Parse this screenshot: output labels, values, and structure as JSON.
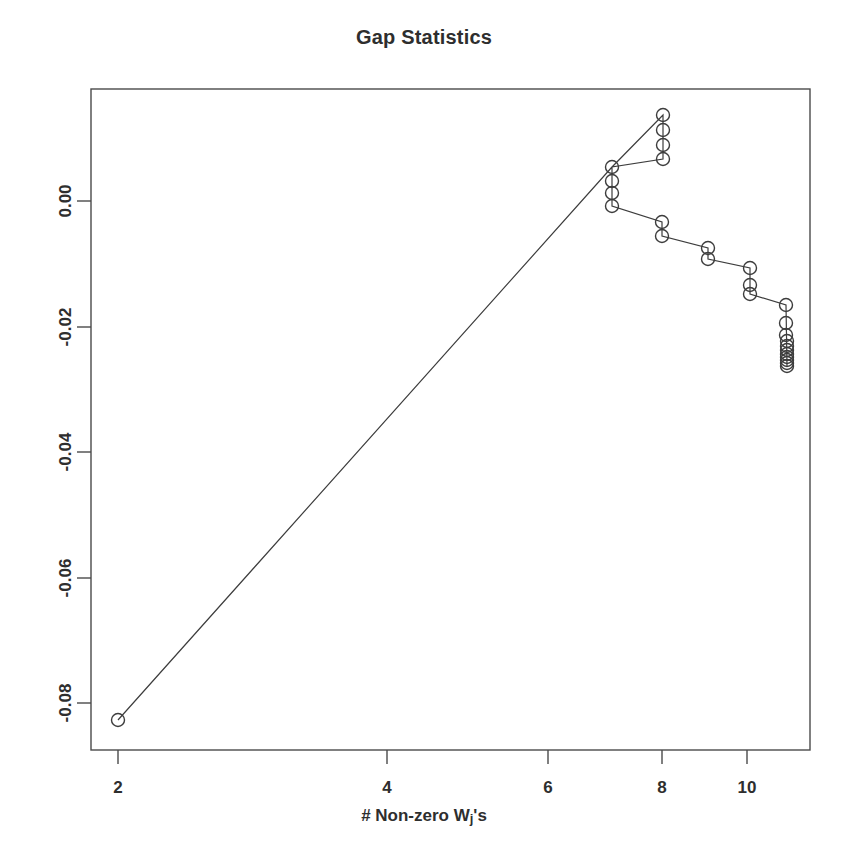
{
  "chart_data": {
    "type": "line",
    "title": "Gap Statistics",
    "xlabel": "# Non-zero Wj's",
    "xlabel_main": "# Non-zero W",
    "xlabel_sub": "j",
    "xlabel_tail": "'s",
    "ylabel": "",
    "marker": "open-circle",
    "grid": false,
    "legend": null,
    "xlim": [
      1.75,
      11.6
    ],
    "ylim": [
      -0.0875,
      0.0215
    ],
    "xticks": [
      2,
      4,
      6,
      8,
      10
    ],
    "xtick_labels": [
      "2",
      "4",
      "6",
      "8",
      "10"
    ],
    "xscale": "log-like (non-uniform tick spacing)",
    "yticks": [
      0.0,
      -0.02,
      -0.04,
      -0.06,
      -0.08
    ],
    "ytick_labels": [
      "0.00",
      "-0.02",
      "-0.04",
      "-0.06",
      "-0.08"
    ],
    "series": [
      {
        "name": "gap statistic",
        "x": [
          2.0,
          7.0,
          7.0,
          7.0,
          7.0,
          8.0,
          8.0,
          8.0,
          8.0,
          8.05,
          8.05,
          8.6,
          8.6,
          9.2,
          9.2,
          9.2,
          10.0,
          10.0,
          10.0,
          10.5,
          10.5,
          10.5,
          10.5,
          10.5,
          10.5,
          10.5,
          10.5
        ],
        "y": [
          -0.0827,
          0.0055,
          0.0026,
          -0.0005,
          -0.0035,
          0.0142,
          0.0118,
          0.0095,
          0.007,
          -0.0034,
          -0.0056,
          -0.0075,
          -0.009,
          -0.0105,
          -0.0133,
          -0.0147,
          -0.0162,
          -0.019,
          -0.0203,
          -0.0216,
          -0.0222,
          -0.0226,
          -0.023,
          -0.0234,
          -0.0238,
          -0.0243,
          -0.0248
        ]
      }
    ],
    "points_px": {
      "note": "pixel coordinates used for rendering the path and markers",
      "coords": [
        [
          118,
          720
        ],
        [
          612,
          167
        ],
        [
          612,
          181
        ],
        [
          612,
          193
        ],
        [
          612,
          206
        ],
        [
          663,
          115
        ],
        [
          663,
          130
        ],
        [
          663,
          145
        ],
        [
          663,
          159
        ],
        [
          662,
          222
        ],
        [
          662,
          236
        ],
        [
          708,
          248
        ],
        [
          708,
          259
        ],
        [
          750,
          268
        ],
        [
          750,
          285
        ],
        [
          750,
          294
        ],
        [
          786,
          305
        ],
        [
          786,
          323
        ],
        [
          786,
          335
        ],
        [
          787,
          341
        ],
        [
          787,
          346
        ],
        [
          787,
          350
        ],
        [
          787,
          354
        ],
        [
          787,
          357
        ],
        [
          787,
          360
        ],
        [
          787,
          363
        ],
        [
          787,
          366
        ]
      ],
      "path_order": [
        [
          118,
          720
        ],
        [
          612,
          167
        ],
        [
          663,
          115
        ],
        [
          663,
          159
        ],
        [
          612,
          167
        ],
        [
          612,
          206
        ],
        [
          662,
          222
        ],
        [
          662,
          236
        ],
        [
          708,
          248
        ],
        [
          708,
          259
        ],
        [
          750,
          268
        ],
        [
          750,
          294
        ],
        [
          786,
          305
        ],
        [
          787,
          366
        ]
      ]
    },
    "axis_px": {
      "frame_left": 91,
      "frame_right": 810,
      "frame_top": 89,
      "frame_bottom": 750,
      "xtick_px": [
        118,
        387,
        548,
        662,
        747
      ],
      "ytick_px": [
        201,
        327,
        452,
        578,
        703
      ]
    },
    "colors": {
      "line": "#3d3d3d",
      "marker": "#3d3d3d",
      "frame": "#4a4a4a",
      "text": "#2e2e2e",
      "background": "#ffffff"
    }
  }
}
